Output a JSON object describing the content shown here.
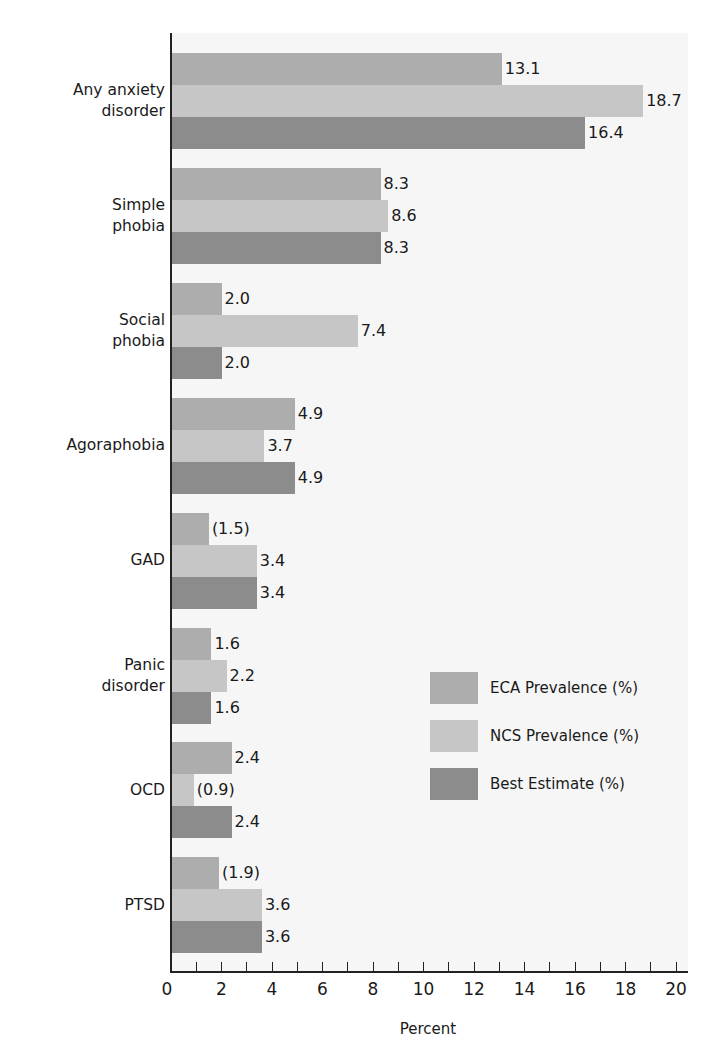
{
  "chart_data": {
    "type": "bar",
    "orientation": "horizontal",
    "title": "",
    "xlabel": "Percent",
    "ylabel": "",
    "xlim": [
      0,
      20
    ],
    "x_ticks": [
      0,
      2,
      4,
      6,
      8,
      10,
      12,
      14,
      16,
      18,
      20
    ],
    "x_minor_tick_step": 1,
    "grid": false,
    "legend_position": "lower right (inside plot)",
    "categories": [
      "Any anxiety disorder",
      "Simple phobia",
      "Social phobia",
      "Agoraphobia",
      "GAD",
      "Panic disorder",
      "OCD",
      "PTSD"
    ],
    "category_display": [
      [
        "Any anxiety",
        "disorder"
      ],
      [
        "Simple",
        "phobia"
      ],
      [
        "Social",
        "phobia"
      ],
      [
        "Agoraphobia"
      ],
      [
        "GAD"
      ],
      [
        "Panic",
        "disorder"
      ],
      [
        "OCD"
      ],
      [
        "PTSD"
      ]
    ],
    "series": [
      {
        "name": "ECA Prevalence (%)",
        "color": "#adadad",
        "values": [
          13.1,
          8.3,
          2.0,
          4.9,
          1.5,
          1.6,
          2.4,
          1.9
        ],
        "labels": [
          "13.1",
          "8.3",
          "2.0",
          "4.9",
          "(1.5)",
          "1.6",
          "2.4",
          "(1.9)"
        ]
      },
      {
        "name": "NCS Prevalence (%)",
        "color": "#c6c6c6",
        "values": [
          18.7,
          8.6,
          7.4,
          3.7,
          3.4,
          2.2,
          0.9,
          3.6
        ],
        "labels": [
          "18.7",
          "8.6",
          "7.4",
          "3.7",
          "3.4",
          "2.2",
          "(0.9)",
          "3.6"
        ]
      },
      {
        "name": "Best Estimate (%)",
        "color": "#8c8c8c",
        "values": [
          16.4,
          8.3,
          2.0,
          4.9,
          3.4,
          1.6,
          2.4,
          3.6
        ],
        "labels": [
          "16.4",
          "8.3",
          "2.0",
          "4.9",
          "3.4",
          "1.6",
          "2.4",
          "3.6"
        ]
      }
    ]
  }
}
